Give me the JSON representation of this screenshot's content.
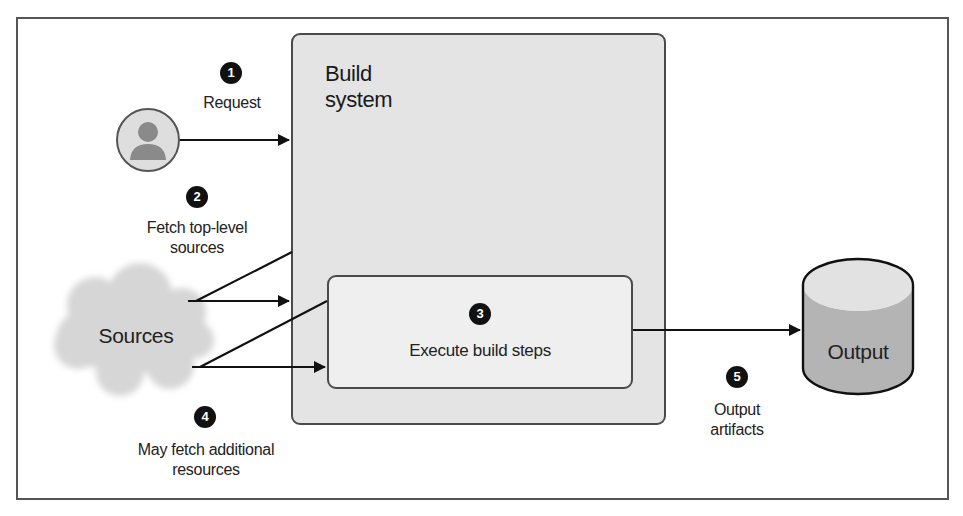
{
  "diagram": {
    "title": "Build system",
    "title_lines": [
      "Build",
      "system"
    ],
    "colors": {
      "line": "#111111",
      "frame": "#555555",
      "build_box_fill": "#e4e4e4",
      "step_box_fill": "#efefef",
      "cloud_fill": "#d6d6d6",
      "avatar_fill": "#dedede",
      "avatar_figure": "#8a8a8a",
      "cylinder_top": "#e2e2e2",
      "cylinder_body": "#b4b4b4",
      "badge_fill": "#111111",
      "badge_text": "#ffffff"
    },
    "nodes": {
      "user": {
        "icon": "user-icon"
      },
      "sources": {
        "label": "Sources",
        "icon": "cloud-icon"
      },
      "build_system": {
        "label_line1": "Build",
        "label_line2": "system"
      },
      "build_steps": {
        "label": "Execute build steps"
      },
      "output": {
        "label": "Output",
        "icon": "database-cylinder-icon"
      }
    },
    "steps": [
      {
        "number": "1",
        "label_line1": "Request",
        "label_line2": ""
      },
      {
        "number": "2",
        "label_line1": "Fetch top-level",
        "label_line2": "sources"
      },
      {
        "number": "3",
        "label_line1": "Execute build steps",
        "label_line2": ""
      },
      {
        "number": "4",
        "label_line1": "May fetch additional",
        "label_line2": "resources"
      },
      {
        "number": "5",
        "label_line1": "Output",
        "label_line2": "artifacts"
      }
    ]
  }
}
